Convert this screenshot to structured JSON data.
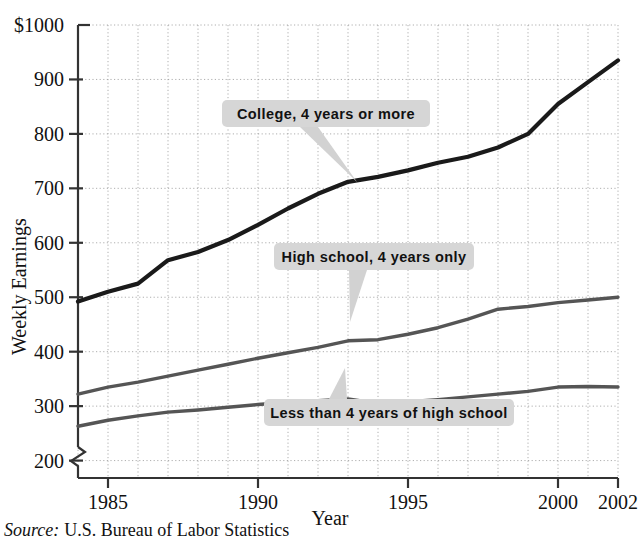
{
  "chart_data": {
    "type": "line",
    "title": "",
    "xlabel": "Year",
    "ylabel": "Weekly Earnings",
    "source": "U.S. Bureau of Labor Statistics",
    "source_prefix": "Source:",
    "xlim": [
      1984,
      2002
    ],
    "ylim": [
      150,
      1000
    ],
    "y_axis_break": true,
    "grid": true,
    "legend_position": "inline-callouts",
    "x_tick_labels": [
      "1985",
      "1990",
      "1995",
      "2000",
      "2002"
    ],
    "x_tick_values": [
      1985,
      1990,
      1995,
      2000,
      2002
    ],
    "y_tick_labels": [
      "$1000",
      "900",
      "800",
      "700",
      "600",
      "500",
      "400",
      "300",
      "200"
    ],
    "y_tick_values": [
      1000,
      900,
      800,
      700,
      600,
      500,
      400,
      300,
      200
    ],
    "x": [
      1984,
      1985,
      1986,
      1987,
      1988,
      1989,
      1990,
      1991,
      1992,
      1993,
      1994,
      1995,
      1996,
      1997,
      1998,
      1999,
      2000,
      2001,
      2002
    ],
    "series": [
      {
        "name": "College, 4 years or more",
        "color": "#1a1a1a",
        "width": 4.2,
        "values": [
          492,
          510,
          525,
          568,
          583,
          605,
          633,
          663,
          690,
          712,
          721,
          733,
          747,
          758,
          775,
          800,
          855,
          895,
          935
        ]
      },
      {
        "name": "High school, 4 years only",
        "color": "#555555",
        "width": 3.4,
        "values": [
          322,
          335,
          344,
          355,
          366,
          377,
          388,
          398,
          408,
          420,
          422,
          432,
          444,
          460,
          478,
          483,
          490,
          495,
          500
        ]
      },
      {
        "name": "Less than 4 years of high school",
        "color": "#555555",
        "width": 3.4,
        "values": [
          263,
          274,
          282,
          289,
          293,
          298,
          303,
          307,
          310,
          313,
          305,
          308,
          312,
          317,
          322,
          327,
          335,
          336,
          335
        ]
      }
    ],
    "annotations": [
      {
        "label": "College, 4 years or more",
        "box_x": 222,
        "box_y": 100,
        "box_w": 208,
        "box_h": 27,
        "tail_to_x": 357,
        "tail_to_y": 182,
        "tail_from_x": 309,
        "tail_from_y": 127,
        "tail_half": 9
      },
      {
        "label": "High school, 4 years only",
        "box_x": 274,
        "box_y": 243,
        "box_w": 200,
        "box_h": 27,
        "tail_to_x": 350,
        "tail_to_y": 322,
        "tail_from_x": 358,
        "tail_from_y": 270,
        "tail_half": 9
      },
      {
        "label": "Less than 4 years of high school",
        "box_x": 264,
        "box_y": 399,
        "box_w": 250,
        "box_h": 27,
        "tail_to_x": 345,
        "tail_to_y": 368,
        "tail_from_x": 338,
        "tail_from_y": 399,
        "tail_half": 9
      }
    ]
  }
}
